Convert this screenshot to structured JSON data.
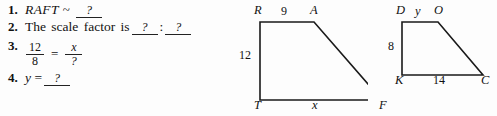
{
  "page": {
    "background_color": "#fdfdfd",
    "ink_color": "#111111"
  },
  "questions": [
    {
      "number": "1.",
      "text_before": "RAFT",
      "symbol": "~",
      "blank1": "?",
      "type": "similarity-statement"
    },
    {
      "number": "2.",
      "text_before": "The scale factor is",
      "blank1": "?",
      "separator": ":",
      "blank2": "?",
      "type": "ratio"
    },
    {
      "number": "3.",
      "fraction_left_numerator": "12",
      "fraction_left_denominator": "8",
      "equals": "=",
      "fraction_right_numerator": "x",
      "fraction_right_denominator": "?",
      "type": "proportion"
    },
    {
      "number": "4.",
      "text_before": "y",
      "equals": "=",
      "blank1": "?",
      "type": "value"
    }
  ],
  "figures": [
    {
      "name": "trapezoid-raft",
      "vertices": [
        {
          "label": "R",
          "x": 32,
          "y": 22
        },
        {
          "label": "A",
          "x": 86,
          "y": 22
        },
        {
          "label": "F",
          "x": 154,
          "y": 100
        },
        {
          "label": "T",
          "x": 32,
          "y": 100
        }
      ],
      "side_labels": [
        {
          "label": "9",
          "side": "RA",
          "x": 56,
          "y": 13
        },
        {
          "label": "12",
          "side": "RT",
          "x": 16,
          "y": 57
        },
        {
          "label": "x",
          "side": "TF",
          "x": 86,
          "y": 110
        }
      ]
    },
    {
      "name": "trapezoid-dock",
      "vertices": [
        {
          "label": "D",
          "x": 22,
          "y": 22
        },
        {
          "label": "O",
          "x": 58,
          "y": 22
        },
        {
          "label": "C",
          "x": 103,
          "y": 75
        },
        {
          "label": "K",
          "x": 22,
          "y": 75
        }
      ],
      "side_labels": [
        {
          "label": "y",
          "side": "DO",
          "x": 40,
          "y": 13
        },
        {
          "label": "8",
          "side": "DK",
          "x": 11,
          "y": 47
        },
        {
          "label": "14",
          "side": "KC",
          "x": 58,
          "y": 85
        }
      ]
    }
  ]
}
